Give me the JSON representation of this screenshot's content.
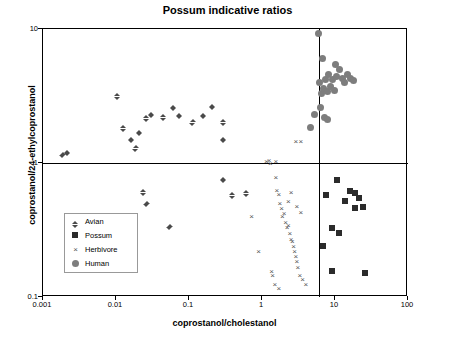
{
  "chart_data": {
    "type": "scatter",
    "title": "Possum indicative ratios",
    "xlabel": "coprostanol/cholestanol",
    "ylabel": "coprostanol/24-ethylcoprostanol",
    "xscale": "log",
    "yscale": "log",
    "xlim": [
      0.001,
      100
    ],
    "ylim": [
      0.1,
      10
    ],
    "xticks": [
      "0.001",
      "0.01",
      "0.1",
      "1",
      "10",
      "100"
    ],
    "yticks": [
      "0.1",
      "1",
      "10"
    ],
    "grid": false,
    "reference_lines": {
      "horizontal_y": 1,
      "vertical_x": 6
    },
    "legend": {
      "position": "lower-left-inside",
      "entries": [
        {
          "name": "Avian",
          "marker": "diamond",
          "color": "#4a4a4a"
        },
        {
          "name": "Possum",
          "marker": "square",
          "color": "#2b2b2b"
        },
        {
          "name": "Herbivore",
          "marker": "x",
          "color": "#555555"
        },
        {
          "name": "Human",
          "marker": "circle",
          "color": "#7d7d7d"
        }
      ]
    },
    "series": [
      {
        "name": "Avian",
        "marker": "diamond",
        "points": [
          [
            0.0019,
            1.2
          ],
          [
            0.0022,
            1.25
          ],
          [
            0.0105,
            3.3
          ],
          [
            0.0128,
            1.9
          ],
          [
            0.0165,
            1.55
          ],
          [
            0.019,
            1.35
          ],
          [
            0.021,
            1.75
          ],
          [
            0.0265,
            2.25
          ],
          [
            0.031,
            2.4
          ],
          [
            0.045,
            2.3
          ],
          [
            0.062,
            2.7
          ],
          [
            0.075,
            2.35
          ],
          [
            0.115,
            2.1
          ],
          [
            0.16,
            2.35
          ],
          [
            0.21,
            2.75
          ],
          [
            0.3,
            2.1
          ],
          [
            0.3,
            1.55
          ],
          [
            0.024,
            0.63
          ],
          [
            0.027,
            0.52
          ],
          [
            0.055,
            0.35
          ],
          [
            0.3,
            0.78
          ],
          [
            0.4,
            0.6
          ],
          [
            0.62,
            0.62
          ]
        ]
      },
      {
        "name": "Possum",
        "marker": "square",
        "points": [
          [
            7.5,
            0.58
          ],
          [
            9.0,
            0.33
          ],
          [
            10.5,
            0.75
          ],
          [
            11.5,
            0.3
          ],
          [
            13.5,
            0.52
          ],
          [
            16.0,
            0.62
          ],
          [
            18.5,
            0.46
          ],
          [
            19.0,
            0.6
          ],
          [
            21.0,
            0.55
          ],
          [
            24.0,
            0.47
          ],
          [
            26.0,
            0.15
          ],
          [
            9.0,
            0.155
          ],
          [
            6.8,
            0.24
          ]
        ]
      },
      {
        "name": "Herbivore",
        "marker": "x",
        "points": [
          [
            0.72,
            0.4
          ],
          [
            0.9,
            0.22
          ],
          [
            1.15,
            1.02
          ],
          [
            1.25,
            1.05
          ],
          [
            1.3,
            1.0
          ],
          [
            1.55,
            1.02
          ],
          [
            1.55,
            0.78
          ],
          [
            1.6,
            0.62
          ],
          [
            1.7,
            0.58
          ],
          [
            1.75,
            0.5
          ],
          [
            1.85,
            0.46
          ],
          [
            1.9,
            0.4
          ],
          [
            2.0,
            0.42
          ],
          [
            2.1,
            0.36
          ],
          [
            2.2,
            0.33
          ],
          [
            2.3,
            0.34
          ],
          [
            2.4,
            0.3
          ],
          [
            2.5,
            0.27
          ],
          [
            2.6,
            0.26
          ],
          [
            2.7,
            0.24
          ],
          [
            2.8,
            0.22
          ],
          [
            2.9,
            0.2
          ],
          [
            3.0,
            0.185
          ],
          [
            3.1,
            0.165
          ],
          [
            3.3,
            0.145
          ],
          [
            3.6,
            0.135
          ],
          [
            4.0,
            0.125
          ],
          [
            2.3,
            0.52
          ],
          [
            2.5,
            0.6
          ],
          [
            3.0,
            0.47
          ],
          [
            3.4,
            0.43
          ],
          [
            1.4,
            0.145
          ],
          [
            1.5,
            0.125
          ],
          [
            1.7,
            0.115
          ],
          [
            2.9,
            1.45
          ],
          [
            3.4,
            1.45
          ],
          [
            1.35,
            0.155
          ]
        ]
      },
      {
        "name": "Human",
        "marker": "circle",
        "points": [
          [
            4.6,
            1.85
          ],
          [
            5.2,
            2.3
          ],
          [
            6.2,
            4.0
          ],
          [
            6.6,
            3.3
          ],
          [
            7.0,
            3.6
          ],
          [
            7.4,
            4.2
          ],
          [
            7.8,
            3.4
          ],
          [
            8.2,
            4.6
          ],
          [
            8.6,
            3.7
          ],
          [
            9.2,
            4.2
          ],
          [
            9.8,
            3.5
          ],
          [
            10.5,
            4.4
          ],
          [
            11.5,
            5.0
          ],
          [
            12.5,
            4.3
          ],
          [
            13.5,
            4.0
          ],
          [
            15.0,
            4.6
          ],
          [
            16.5,
            4.3
          ],
          [
            18.0,
            4.1
          ],
          [
            7.2,
            2.2
          ],
          [
            8.0,
            2.1
          ],
          [
            6.4,
            2.6
          ],
          [
            10.0,
            5.4
          ],
          [
            6.0,
            9.2
          ],
          [
            6.8,
            6.0
          ]
        ]
      }
    ]
  }
}
